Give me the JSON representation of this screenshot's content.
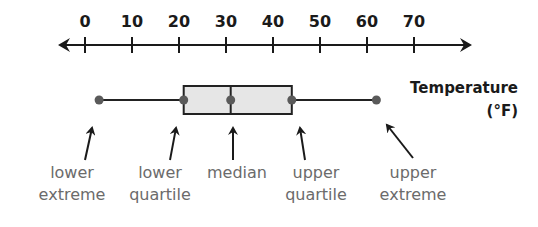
{
  "chart_data": {
    "type": "boxplot",
    "title": "Temperature",
    "unit": "(°F)",
    "axis": {
      "ticks": [
        0,
        10,
        20,
        30,
        40,
        50,
        60,
        70
      ],
      "tick_labels": [
        "0",
        "10",
        "20",
        "30",
        "40",
        "50",
        "60",
        "70"
      ],
      "range": [
        -5,
        75
      ],
      "arrows_both_ends": true
    },
    "five_number_summary": {
      "lower_extreme": 3,
      "lower_quartile": 21,
      "median": 31,
      "upper_quartile": 44,
      "upper_extreme": 62
    },
    "annotations": [
      {
        "line1": "lower",
        "line2": "extreme",
        "points_to": "lower_extreme"
      },
      {
        "line1": "lower",
        "line2": "quartile",
        "points_to": "lower_quartile"
      },
      {
        "line1": "median",
        "line2": "",
        "points_to": "median"
      },
      {
        "line1": "upper",
        "line2": "quartile",
        "points_to": "upper_quartile"
      },
      {
        "line1": "upper",
        "line2": "extreme",
        "points_to": "upper_extreme"
      }
    ]
  },
  "colors": {
    "axis": "#1a1a1a",
    "box_fill": "#e6e6e6",
    "point": "#5a5a5a",
    "annotation_text": "#6b6b6b"
  }
}
